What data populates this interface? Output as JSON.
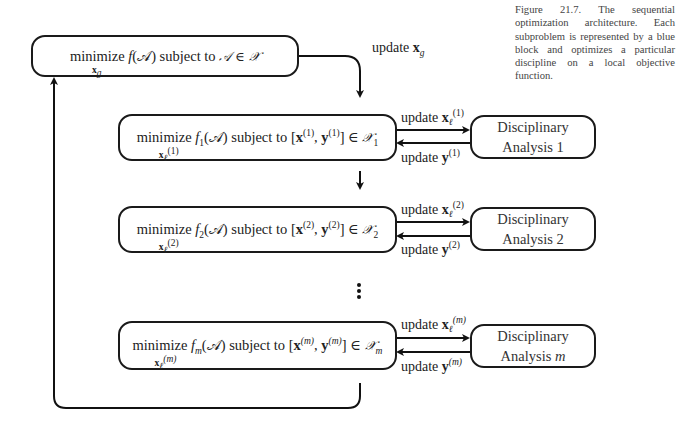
{
  "caption": {
    "figure_label": "Figure 21.7.",
    "text": "The sequential optimization architecture. Each subproblem is represented by a blue block and optimizes a particular discipline on a local objective function."
  },
  "system_box": {
    "prefix": "minimize",
    "objective": "f(𝒜)",
    "middle": "subject to",
    "constraint": "𝒜 ∈ 𝒳",
    "under": "x",
    "under_sub": "g"
  },
  "labels": {
    "update_global": "update",
    "update_global_var": "x",
    "update_global_sub": "g"
  },
  "subproblems": [
    {
      "index": "1",
      "objective": "f",
      "objective_sub": "1",
      "constraint_sup": "(1)",
      "constraint_set_sub": "1",
      "under_sup": "(1)",
      "update_x_label": "update",
      "update_y_label": "update",
      "disc_line1": "Disciplinary",
      "disc_line2": "Analysis 1"
    },
    {
      "index": "2",
      "objective": "f",
      "objective_sub": "2",
      "constraint_sup": "(2)",
      "constraint_set_sub": "2",
      "under_sup": "(2)",
      "update_x_label": "update",
      "update_y_label": "update",
      "disc_line1": "Disciplinary",
      "disc_line2": "Analysis 2"
    },
    {
      "index": "m",
      "objective": "f",
      "objective_sub": "m",
      "constraint_sup": "(m)",
      "constraint_set_sub": "m",
      "under_sup": "(m)",
      "update_x_label": "update",
      "update_y_label": "update",
      "disc_line1": "Disciplinary",
      "disc_line2": "Analysis",
      "disc_line2_var": "m"
    }
  ],
  "common": {
    "minimize": "minimize",
    "subject_to": "subject to",
    "x": "x",
    "y": "y",
    "local_sub": "ℓ",
    "A": "(𝒜)",
    "X": "𝒳",
    "in": "∈"
  }
}
